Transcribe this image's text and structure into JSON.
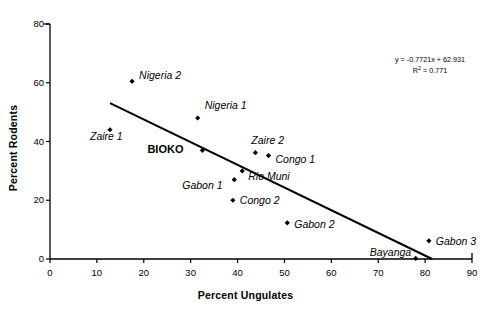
{
  "chart_data": {
    "type": "scatter",
    "title": "",
    "xlabel": "Percent Ungulates",
    "ylabel": "Percent Rodents",
    "xlim": [
      0,
      90
    ],
    "ylim": [
      0,
      80
    ],
    "xticks": [
      0,
      10,
      20,
      30,
      40,
      50,
      60,
      70,
      80,
      90
    ],
    "yticks": [
      0,
      20,
      40,
      60,
      80
    ],
    "grid": false,
    "legend": "none",
    "marker": "diamond",
    "marker_color": "#000000",
    "points": [
      {
        "label": "Nigeria 2",
        "x": 17.5,
        "y": 60.5,
        "label_dx": 7,
        "label_dy": -6,
        "bold": false
      },
      {
        "label": "Nigeria 1",
        "x": 31.5,
        "y": 48.0,
        "label_dx": 7,
        "label_dy": -13,
        "bold": false
      },
      {
        "label": "Zaire 1",
        "x": 12.8,
        "y": 44.0,
        "label_dx": -20,
        "label_dy": 6,
        "bold": false
      },
      {
        "label": "BIOKO",
        "x": 32.5,
        "y": 37.0,
        "label_dx": -56,
        "label_dy": -1,
        "bold": true
      },
      {
        "label": "Zaire 2",
        "x": 43.8,
        "y": 36.2,
        "label_dx": -4,
        "label_dy": -13,
        "bold": false
      },
      {
        "label": "Congo 1",
        "x": 46.6,
        "y": 35.2,
        "label_dx": 7,
        "label_dy": 3,
        "bold": false
      },
      {
        "label": "Rio Muni",
        "x": 41.0,
        "y": 30.0,
        "label_dx": 6,
        "label_dy": 5,
        "bold": false
      },
      {
        "label": "Gabon 1",
        "x": 39.3,
        "y": 27.0,
        "label_dx": -52,
        "label_dy": 5,
        "bold": false
      },
      {
        "label": "Congo 2",
        "x": 39.0,
        "y": 20.0,
        "label_dx": 7,
        "label_dy": 0,
        "bold": false
      },
      {
        "label": "Gabon 2",
        "x": 50.6,
        "y": 12.3,
        "label_dx": 7,
        "label_dy": 1,
        "bold": false
      },
      {
        "label": "Bayanga",
        "x": 78.0,
        "y": 0.2,
        "label_dx": -46,
        "label_dy": -6,
        "bold": false
      },
      {
        "label": "Gabon 3",
        "x": 80.8,
        "y": 6.2,
        "label_dx": 7,
        "label_dy": 0,
        "bold": false
      }
    ],
    "trendline": {
      "slope": -0.7721,
      "intercept": 62.931,
      "r_squared": 0.771,
      "x_start": 12.8,
      "x_end": 81.5,
      "equation_text": "y = -0.7721x + 62.931",
      "r2_text_prefix": "R",
      "r2_text_sup": "2",
      "r2_text_suffix": " = 0.771"
    }
  }
}
